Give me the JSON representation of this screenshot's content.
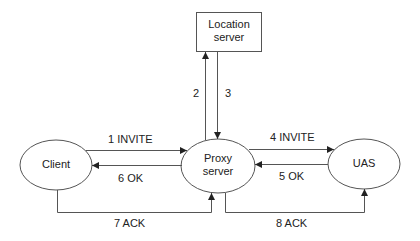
{
  "diagram": {
    "type": "SIP proxy call flow",
    "nodes": [
      {
        "id": "location",
        "label_line1": "Location",
        "label_line2": "server",
        "shape": "rectangle"
      },
      {
        "id": "client",
        "label": "Client",
        "shape": "ellipse"
      },
      {
        "id": "proxy",
        "label_line1": "Proxy",
        "label_line2": "server",
        "shape": "ellipse"
      },
      {
        "id": "uas",
        "label": "UAS",
        "shape": "ellipse"
      }
    ],
    "edges": [
      {
        "step": "1",
        "label": "1 INVITE",
        "from": "client",
        "to": "proxy"
      },
      {
        "step": "2",
        "label": "2",
        "from": "proxy",
        "to": "location"
      },
      {
        "step": "3",
        "label": "3",
        "from": "location",
        "to": "proxy"
      },
      {
        "step": "4",
        "label": "4 INVITE",
        "from": "proxy",
        "to": "uas"
      },
      {
        "step": "5",
        "label": "5 OK",
        "from": "uas",
        "to": "proxy"
      },
      {
        "step": "6",
        "label": "6 OK",
        "from": "proxy",
        "to": "client"
      },
      {
        "step": "7",
        "label": "7 ACK",
        "from": "client",
        "to": "proxy"
      },
      {
        "step": "8",
        "label": "8 ACK",
        "from": "proxy",
        "to": "uas"
      }
    ],
    "colors": {
      "stroke": "#555555",
      "text": "#222222",
      "background": "#ffffff"
    }
  }
}
